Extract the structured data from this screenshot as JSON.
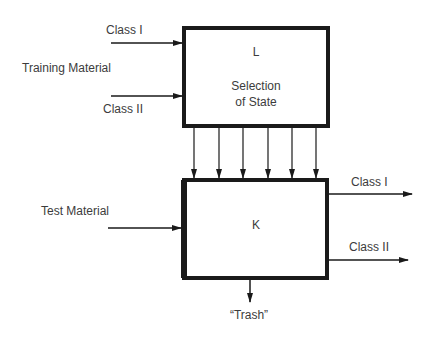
{
  "diagram": {
    "type": "block-diagram",
    "colors": {
      "line": "#1a1a1a",
      "text": "#3c3c3c",
      "background": "#ffffff"
    },
    "inputs": {
      "training_material": {
        "label": "Training Material",
        "class_1": "Class I",
        "class_2": "Class II"
      },
      "test_material": {
        "label": "Test Material"
      }
    },
    "box_l": {
      "id": "L",
      "line1": "Selection",
      "line2": "of State"
    },
    "connections_l_to_k": {
      "count": 6
    },
    "box_k": {
      "id": "K"
    },
    "outputs": {
      "class_1": "Class I",
      "class_2": "Class II",
      "trash": "“Trash”"
    }
  }
}
